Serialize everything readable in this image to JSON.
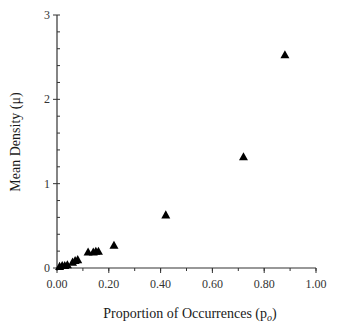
{
  "chart_data": {
    "type": "scatter",
    "title": "",
    "xlabel": "Proportion of Occurrences (p",
    "xlabel_subscript": "o",
    "xlabel_suffix": ")",
    "ylabel": "Mean Density (μ)",
    "xlim": [
      0,
      1.0
    ],
    "ylim": [
      0,
      3
    ],
    "x_ticks": [
      0.0,
      0.2,
      0.4,
      0.6,
      0.8,
      1.0
    ],
    "x_tick_labels": [
      "0.00",
      "0.20",
      "0.40",
      "0.60",
      "0.80",
      "1.00"
    ],
    "x_minor_step": 0.1,
    "y_ticks": [
      0,
      1,
      2,
      3
    ],
    "y_tick_labels": [
      "0",
      "1",
      "2",
      "3"
    ],
    "y_minor_step": 0.2,
    "grid": false,
    "legend": null,
    "marker": "triangle",
    "marker_color": "#000000",
    "series": [
      {
        "name": "observations",
        "points": [
          {
            "x": 0.01,
            "y": 0.02
          },
          {
            "x": 0.02,
            "y": 0.03
          },
          {
            "x": 0.03,
            "y": 0.03
          },
          {
            "x": 0.04,
            "y": 0.04
          },
          {
            "x": 0.06,
            "y": 0.07
          },
          {
            "x": 0.07,
            "y": 0.09
          },
          {
            "x": 0.08,
            "y": 0.1
          },
          {
            "x": 0.12,
            "y": 0.19
          },
          {
            "x": 0.14,
            "y": 0.19
          },
          {
            "x": 0.15,
            "y": 0.2
          },
          {
            "x": 0.16,
            "y": 0.2
          },
          {
            "x": 0.22,
            "y": 0.27
          },
          {
            "x": 0.42,
            "y": 0.63
          },
          {
            "x": 0.72,
            "y": 1.32
          },
          {
            "x": 0.88,
            "y": 2.53
          }
        ]
      }
    ]
  }
}
